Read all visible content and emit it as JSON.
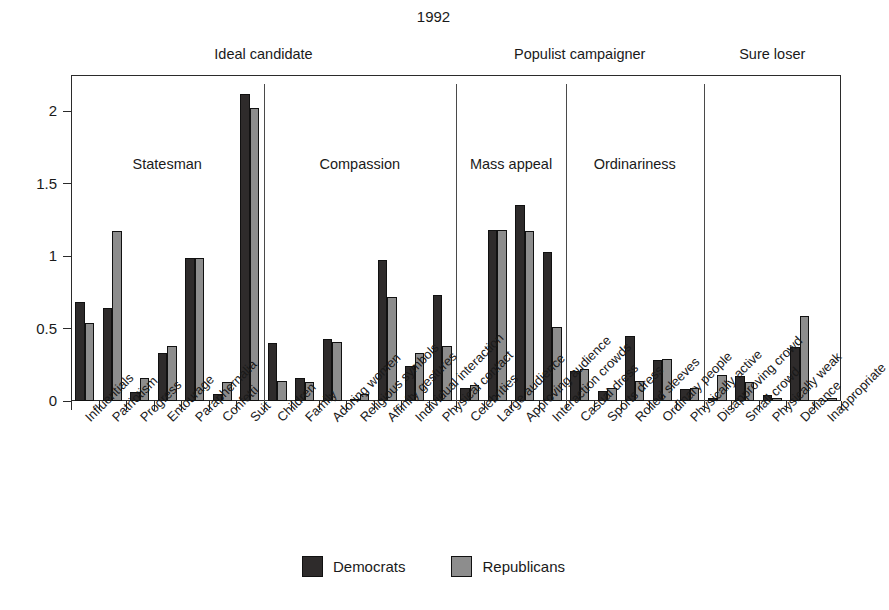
{
  "chart_data": {
    "type": "bar",
    "title": "1992",
    "xlabel": "",
    "ylabel": "",
    "ylim": [
      0,
      2.25
    ],
    "yticks": [
      0,
      0.5,
      1,
      1.5,
      2
    ],
    "ytick_labels": [
      "0",
      "0.5",
      "1",
      "1.5",
      "2"
    ],
    "grid": false,
    "legend_position": "bottom",
    "orientation": "vertical",
    "series": [
      {
        "name": "Democrats",
        "color": "#2e2b2b",
        "values": [
          0.68,
          0.64,
          0.06,
          0.33,
          0.99,
          0.05,
          2.12,
          0.4,
          0.16,
          0.43,
          0.01,
          0.97,
          0.24,
          0.73,
          0.09,
          1.18,
          1.35,
          1.03,
          0.21,
          0.07,
          0.45,
          0.28,
          0.08,
          0.02,
          0.17,
          0.04,
          0.37,
          0.0
        ]
      },
      {
        "name": "Republicans",
        "color": "#8d8d8d",
        "values": [
          0.54,
          1.17,
          0.16,
          0.38,
          0.99,
          0.13,
          2.02,
          0.14,
          0.13,
          0.41,
          0.05,
          0.72,
          0.33,
          0.38,
          0.11,
          1.18,
          1.17,
          0.51,
          0.22,
          0.09,
          0.14,
          0.29,
          0.09,
          0.18,
          0.13,
          0.02,
          0.59,
          0.02
        ]
      }
    ],
    "categories": [
      "Influentials",
      "Patriotism",
      "Progress",
      "Entourage",
      "Paraphernalia",
      "Confetti",
      "Suit",
      "Children",
      "Family",
      "Adoring women",
      "Religious symbols",
      "Affinity gestures",
      "Individual interaction",
      "Physical contact",
      "Celebrities",
      "Large audience",
      "Approving audience",
      "Interaction crowds",
      "Casual dress",
      "Sports dress",
      "Rolled sleeves",
      "Ordinary people",
      "Physically active",
      "Disapproving crowd",
      "Small crowd",
      "Physically weak",
      "Defiance",
      "Inappropriate"
    ],
    "groups": [
      {
        "label": "Statesman",
        "start": 0,
        "count": 7
      },
      {
        "label": "Compassion",
        "start": 7,
        "count": 7
      },
      {
        "label": "Mass appeal",
        "start": 14,
        "count": 4
      },
      {
        "label": "Ordinariness",
        "start": 18,
        "count": 5
      },
      {
        "label": "",
        "start": 23,
        "count": 5
      }
    ],
    "supergroups": [
      {
        "label": "Ideal candidate",
        "start": 0,
        "count": 14
      },
      {
        "label": "Populist campaigner",
        "start": 14,
        "count": 9
      },
      {
        "label": "Sure loser",
        "start": 23,
        "count": 5
      }
    ]
  },
  "legend": {
    "items": [
      {
        "label": "Democrats",
        "color": "#2e2b2b"
      },
      {
        "label": "Republicans",
        "color": "#8d8d8d"
      }
    ]
  }
}
